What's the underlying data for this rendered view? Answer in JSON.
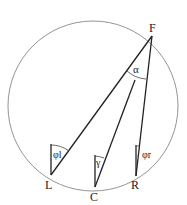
{
  "diagram": {
    "circle": {
      "cx": 93,
      "cy": 106,
      "r": 85,
      "stroke": "#777777"
    },
    "points": {
      "F": {
        "label": "F",
        "x": 152,
        "y": 36
      },
      "L": {
        "label": "L",
        "x": 51,
        "y": 175
      },
      "C": {
        "label": "C",
        "x": 95,
        "y": 187
      },
      "R": {
        "label": "R",
        "x": 136,
        "y": 176
      }
    },
    "angles": {
      "alpha": "α",
      "gamma": "γ",
      "phi_l": "φl",
      "phi_r": "φr"
    },
    "line_color": "#222222"
  }
}
